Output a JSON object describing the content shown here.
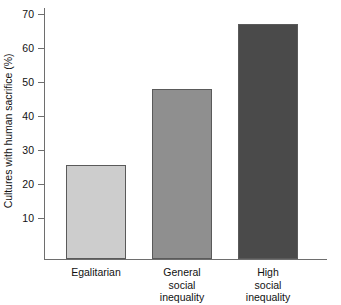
{
  "chart_data": {
    "type": "bar",
    "title": "",
    "xlabel": "",
    "ylabel": "Cultures with human sacrifice (%)",
    "categories": [
      "Egalitarian",
      "General social inequality",
      "High social inequality"
    ],
    "category_labels_multiline": [
      "Egalitarian",
      "General\nsocial\ninequality",
      "High\nsocial\ninequality"
    ],
    "values": [
      25.5,
      48,
      67
    ],
    "ylim": [
      0,
      72
    ],
    "yticks": [
      10,
      20,
      30,
      40,
      50,
      60,
      70
    ],
    "ytick_labels": [
      "10",
      "20",
      "30",
      "40",
      "50",
      "60",
      "70"
    ],
    "grid": false,
    "legend": false,
    "bar_colors": [
      "#cdcdcd",
      "#8f8f8f",
      "#4a4a4a"
    ],
    "bar_edge_color": "#5a5a5a",
    "axis_color": "#6e6e6e",
    "background": "#ffffff"
  }
}
